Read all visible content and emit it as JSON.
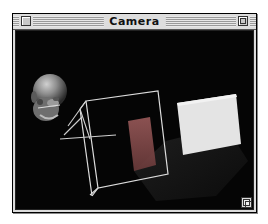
{
  "window": {
    "title": "Camera",
    "controls": {
      "close_box": "close-box",
      "zoom_box": "zoom-box",
      "grow_box": "grow-box"
    }
  },
  "scene": {
    "background_color": "#050505",
    "objects": [
      {
        "name": "head-model",
        "description": "3D bald head (camera model)",
        "color": "#8a8a8a"
      },
      {
        "name": "wireframe-cube",
        "description": "wireframe view frustum box",
        "color": "#d8d8d8"
      },
      {
        "name": "inner-red-plane",
        "description": "semi-transparent reddish plane inside cube",
        "color": "#8a4a4a"
      },
      {
        "name": "white-plane",
        "description": "white rectangular plane",
        "color": "#e6e6e6"
      },
      {
        "name": "shadow",
        "description": "dark shadow beneath planes",
        "color": "#1a1a1a"
      }
    ]
  }
}
